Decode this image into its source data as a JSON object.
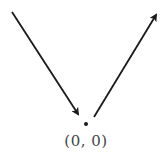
{
  "diagram": {
    "origin": {
      "label": "(0, 0)",
      "point": [
        86,
        124
      ]
    },
    "incoming_arrow": {
      "from": [
        12,
        12
      ],
      "to": [
        79,
        116
      ],
      "direction": "down-right"
    },
    "outgoing_arrow": {
      "from": [
        94,
        117
      ],
      "to": [
        157,
        13
      ],
      "direction": "up-right"
    },
    "colors": {
      "stroke": "#1a1a1a",
      "label": "#444444",
      "background": "#ffffff"
    }
  }
}
